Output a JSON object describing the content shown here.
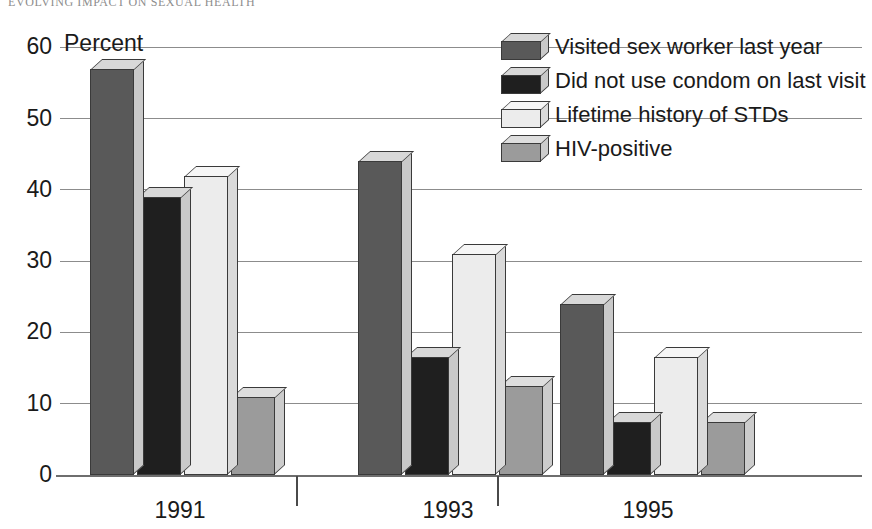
{
  "page_header": "EVOLVING IMPACT ON SEXUAL HEALTH",
  "axis": {
    "y_title": "Percent",
    "y_ticks": [
      "0",
      "10",
      "20",
      "30",
      "40",
      "50",
      "60"
    ],
    "x_ticks": [
      "1991",
      "1993",
      "1995"
    ]
  },
  "legend": {
    "items": [
      {
        "label": "Visited sex worker last year",
        "color": "#595959",
        "top_color": "#d8d8d8",
        "side_color": "#c9c9c9"
      },
      {
        "label": "Did not use condom on last visit",
        "color": "#1f1f1f",
        "top_color": "#d8d8d8",
        "side_color": "#c9c9c9"
      },
      {
        "label": "Lifetime history of STDs",
        "color": "#ececec",
        "top_color": "#f6f6f6",
        "side_color": "#dadada"
      },
      {
        "label": "HIV-positive",
        "color": "#9b9b9b",
        "top_color": "#dedede",
        "side_color": "#cccccc"
      }
    ]
  },
  "chart_data": {
    "type": "bar",
    "title": "",
    "xlabel": "",
    "ylabel": "Percent",
    "ylim": [
      0,
      60
    ],
    "yticks": [
      0,
      10,
      20,
      30,
      40,
      50,
      60
    ],
    "grid": true,
    "legend_position": "top-right",
    "categories": [
      "1991",
      "1993",
      "1995"
    ],
    "series": [
      {
        "name": "Visited sex worker last year",
        "color": "#595959",
        "values": [
          57,
          44,
          24
        ]
      },
      {
        "name": "Did not use condom on last visit",
        "color": "#1f1f1f",
        "values": [
          39,
          16.5,
          7.5
        ]
      },
      {
        "name": "Lifetime history of STDs",
        "color": "#ececec",
        "values": [
          42,
          31,
          16.5
        ]
      },
      {
        "name": "HIV-positive",
        "color": "#9b9b9b",
        "values": [
          11,
          12.5,
          7.5
        ]
      }
    ]
  }
}
